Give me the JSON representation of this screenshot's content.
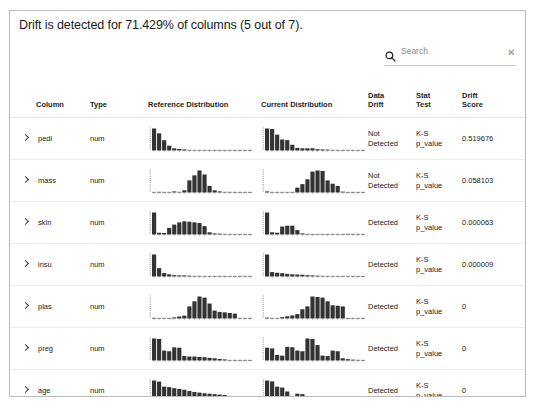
{
  "title": "Drift is detected for 71.429% of columns (5 out of 7).",
  "search": {
    "placeholder": "Search",
    "value": "",
    "icon": "search-icon",
    "clear_label": "✕"
  },
  "table": {
    "headers": {
      "expand": "",
      "column": "Column",
      "type": "Type",
      "reference": "Reference Distribution",
      "current": "Current Distribution",
      "data_drift_l1": "Data",
      "data_drift_l2": "Drift",
      "stat_test_l1": "Stat",
      "stat_test_l2": "Test",
      "drift_score_l1": "Drift",
      "drift_score_l2": "Score"
    },
    "rows": [
      {
        "expand": "›",
        "column": "pedi",
        "type": "num",
        "data_drift": "Not Detected",
        "data_drift_l1": "Not",
        "data_drift_l2": "Detected",
        "stat_test_l1": "K-S",
        "stat_test_l2": "p_value",
        "drift_score": "0.519676"
      },
      {
        "expand": "›",
        "column": "mass",
        "type": "num",
        "data_drift": "Not Detected",
        "data_drift_l1": "Not",
        "data_drift_l2": "Detected",
        "stat_test_l1": "K-S",
        "stat_test_l2": "p_value",
        "drift_score": "0.058103"
      },
      {
        "expand": "›",
        "column": "skin",
        "type": "num",
        "data_drift": "Detected",
        "data_drift_l1": "Detected",
        "data_drift_l2": "",
        "stat_test_l1": "K-S",
        "stat_test_l2": "p_value",
        "drift_score": "0.000063"
      },
      {
        "expand": "›",
        "column": "insu",
        "type": "num",
        "data_drift": "Detected",
        "data_drift_l1": "Detected",
        "data_drift_l2": "",
        "stat_test_l1": "K-S",
        "stat_test_l2": "p_value",
        "drift_score": "0.000009"
      },
      {
        "expand": "›",
        "column": "plas",
        "type": "num",
        "data_drift": "Detected",
        "data_drift_l1": "Detected",
        "data_drift_l2": "",
        "stat_test_l1": "K-S",
        "stat_test_l2": "p_value",
        "drift_score": "0"
      },
      {
        "expand": "›",
        "column": "preg",
        "type": "num",
        "data_drift": "Detected",
        "data_drift_l1": "Detected",
        "data_drift_l2": "",
        "stat_test_l1": "K-S",
        "stat_test_l2": "p_value",
        "drift_score": "0"
      },
      {
        "expand": "›",
        "column": "age",
        "type": "num",
        "data_drift": "Detected",
        "data_drift_l1": "Detected",
        "data_drift_l2": "",
        "stat_test_l1": "K-S",
        "stat_test_l2": "p_value",
        "drift_score": "0"
      }
    ]
  },
  "chart_data": [
    {
      "type": "bar",
      "title": "pedi reference distribution",
      "bar_color": "#333333",
      "ylim": [
        0,
        1
      ],
      "values": [
        1.0,
        0.78,
        0.47,
        0.22,
        0.1,
        0.07,
        0.05,
        0.03,
        0.02,
        0.02,
        0.01,
        0.02,
        0.01,
        0.01,
        0.01,
        0.0,
        0.0,
        0.01,
        0.0,
        0.0
      ]
    },
    {
      "type": "bar",
      "title": "pedi current distribution",
      "bar_color": "#333333",
      "ylim": [
        0,
        1
      ],
      "values": [
        1.0,
        0.98,
        0.72,
        0.5,
        0.47,
        0.26,
        0.12,
        0.1,
        0.1,
        0.1,
        0.06,
        0.05,
        0.04,
        0.03,
        0.02,
        0.02,
        0.01,
        0.0,
        0.01,
        0.0
      ]
    },
    {
      "type": "bar",
      "title": "mass reference distribution",
      "bar_color": "#333333",
      "ylim": [
        0,
        1
      ],
      "values": [
        0.0,
        0.03,
        0.0,
        0.0,
        0.05,
        0.03,
        0.1,
        0.55,
        0.78,
        1.0,
        0.82,
        0.3,
        0.1,
        0.05,
        0.03,
        0.03,
        0.02,
        0.01,
        0.01,
        0.0
      ]
    },
    {
      "type": "bar",
      "title": "mass current distribution",
      "bar_color": "#333333",
      "ylim": [
        0,
        1
      ],
      "values": [
        0.05,
        0.0,
        0.02,
        0.02,
        0.0,
        0.02,
        0.22,
        0.38,
        0.6,
        0.95,
        1.0,
        0.98,
        0.55,
        0.4,
        0.3,
        0.04,
        0.0,
        0.0,
        0.0,
        0.0
      ]
    },
    {
      "type": "bar",
      "title": "skin reference distribution",
      "bar_color": "#333333",
      "ylim": [
        0,
        1
      ],
      "values": [
        1.0,
        0.08,
        0.07,
        0.3,
        0.45,
        0.55,
        0.6,
        0.58,
        0.55,
        0.52,
        0.38,
        0.1,
        0.05,
        0.04,
        0.03,
        0.02,
        0.02,
        0.01,
        0.0,
        0.0
      ]
    },
    {
      "type": "bar",
      "title": "skin current distribution",
      "bar_color": "#333333",
      "ylim": [
        0,
        1
      ],
      "values": [
        1.0,
        0.1,
        0.08,
        0.36,
        0.4,
        0.4,
        0.2,
        0.05,
        0.03,
        0.02,
        0.02,
        0.02,
        0.01,
        0.01,
        0.02,
        0.01,
        0.03,
        0.03,
        0.01,
        0.0
      ]
    },
    {
      "type": "bar",
      "title": "insu reference distribution",
      "bar_color": "#333333",
      "ylim": [
        0,
        1
      ],
      "values": [
        1.0,
        0.38,
        0.16,
        0.1,
        0.06,
        0.05,
        0.05,
        0.04,
        0.03,
        0.03,
        0.02,
        0.02,
        0.01,
        0.01,
        0.01,
        0.01,
        0.01,
        0.01,
        0.0,
        0.0
      ]
    },
    {
      "type": "bar",
      "title": "insu current distribution",
      "bar_color": "#333333",
      "ylim": [
        0,
        1
      ],
      "values": [
        1.0,
        0.2,
        0.17,
        0.15,
        0.12,
        0.1,
        0.09,
        0.08,
        0.06,
        0.05,
        0.04,
        0.03,
        0.02,
        0.02,
        0.01,
        0.01,
        0.01,
        0.01,
        0.0,
        0.0
      ]
    },
    {
      "type": "bar",
      "title": "plas reference distribution",
      "bar_color": "#333333",
      "ylim": [
        0,
        1
      ],
      "values": [
        0.03,
        0.0,
        0.0,
        0.02,
        0.05,
        0.09,
        0.13,
        0.55,
        0.78,
        1.0,
        0.95,
        0.68,
        0.36,
        0.3,
        0.28,
        0.25,
        0.22,
        0.0,
        0.0,
        0.0
      ]
    },
    {
      "type": "bar",
      "title": "plas current distribution",
      "bar_color": "#333333",
      "ylim": [
        0,
        1
      ],
      "values": [
        0.04,
        0.02,
        0.0,
        0.06,
        0.1,
        0.14,
        0.2,
        0.42,
        0.55,
        1.0,
        0.98,
        0.95,
        0.78,
        0.6,
        0.58,
        0.55,
        0.02,
        0.0,
        0.0,
        0.0
      ]
    },
    {
      "type": "bar",
      "title": "preg reference distribution",
      "bar_color": "#333333",
      "ylim": [
        0,
        1
      ],
      "values": [
        1.0,
        0.98,
        0.45,
        0.42,
        0.6,
        0.58,
        0.2,
        0.18,
        0.18,
        0.16,
        0.15,
        0.12,
        0.1,
        0.07,
        0.05,
        0.0,
        0.02,
        0.0,
        0.01,
        0.0
      ]
    },
    {
      "type": "bar",
      "title": "preg current distribution",
      "bar_color": "#333333",
      "ylim": [
        0,
        1
      ],
      "values": [
        0.58,
        0.55,
        0.25,
        0.22,
        0.62,
        0.6,
        0.45,
        0.42,
        1.0,
        0.98,
        0.7,
        0.22,
        0.2,
        0.45,
        0.42,
        0.1,
        0.06,
        0.04,
        0.03,
        0.02
      ]
    },
    {
      "type": "bar",
      "title": "age reference distribution",
      "bar_color": "#333333",
      "ylim": [
        0,
        1
      ],
      "values": [
        1.0,
        0.95,
        0.72,
        0.7,
        0.65,
        0.62,
        0.58,
        0.52,
        0.48,
        0.45,
        0.42,
        0.4,
        0.38,
        0.36,
        0.34,
        0.3,
        0.28,
        0.0,
        0.02,
        0.0
      ]
    },
    {
      "type": "bar",
      "title": "age current distribution",
      "bar_color": "#333333",
      "ylim": [
        0,
        1
      ],
      "values": [
        1.0,
        0.96,
        0.72,
        0.68,
        0.5,
        0.3,
        0.4,
        0.38,
        0.28,
        0.25,
        0.22,
        0.18,
        0.12,
        0.05,
        0.02,
        0.0,
        0.03,
        0.03,
        0.0,
        0.0
      ]
    }
  ]
}
